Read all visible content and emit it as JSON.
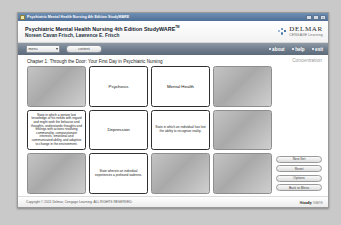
{
  "window": {
    "title": "Psychiatric Mental Health Nursing 4th Edition StudyWARE",
    "minimize_label": "_",
    "maximize_label": "□",
    "close_label": "×"
  },
  "header": {
    "book_title": "Psychiatric Mental Health Nursing 4th Edition StudyWARE",
    "trademark": "TM",
    "authors": "Noreen Cavan Frisch, Lawrence E. Frisch",
    "logo_name": "DELMAR",
    "logo_tagline": "CENGAGE Learning",
    "logo_icon": "delmar-dots-icon"
  },
  "nav": {
    "menu_select_value": "menu",
    "menu_caret_icon": "chevron-down-icon",
    "go_button_label": "content",
    "links": [
      {
        "label": "about",
        "icon": "bullet-icon"
      },
      {
        "label": "help",
        "icon": "bullet-icon"
      },
      {
        "label": "exit",
        "icon": "bullet-icon"
      }
    ]
  },
  "main": {
    "chapter_title": "Chapter 1: Through the Door: Your First Day in Psychiatric Nursing",
    "mode_label": "Concentration"
  },
  "cards": [
    {
      "state": "back",
      "text": ""
    },
    {
      "state": "face",
      "text": "Psychosis",
      "kind": "term"
    },
    {
      "state": "face",
      "text": "Mental Health",
      "kind": "term"
    },
    {
      "state": "back",
      "text": ""
    },
    {
      "state": "face",
      "text": "State in which a person lost knowledge of his needs with regard and might wish the behavior and thoughts, understands thoughts and feelings with actions resolving commonality, compassionate interests, emotional and communicated ability, and adaptive to change in the environment.",
      "kind": "definition"
    },
    {
      "state": "face",
      "text": "Depression",
      "kind": "term"
    },
    {
      "state": "face",
      "text": "State in which an individual has lost the ability to recognize reality.",
      "kind": "definition"
    },
    {
      "state": "back",
      "text": ""
    },
    {
      "state": "back",
      "text": ""
    },
    {
      "state": "face",
      "text": "State wherein an individual experiences a profound sadness.",
      "kind": "definition"
    },
    {
      "state": "back",
      "text": ""
    },
    {
      "state": "back",
      "text": ""
    }
  ],
  "side_buttons": [
    {
      "label": "Next Set"
    },
    {
      "label": "Reset"
    },
    {
      "label": "Options"
    },
    {
      "label": "Back to Menu"
    }
  ],
  "footer": {
    "copyright": "Copyright © 2011 Delmar, Cengage Learning. ALL RIGHTS RESERVED.",
    "logo_main": "Study",
    "logo_sub": "WARE"
  },
  "colors": {
    "navbar": "#6d7b8b",
    "titlebar": "#4f6f96",
    "accent": "#1a4f8a"
  }
}
